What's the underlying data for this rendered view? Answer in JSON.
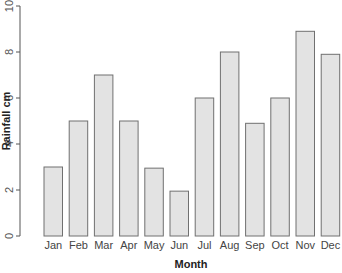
{
  "chart_data": {
    "type": "bar",
    "title": "",
    "xlabel": "Month",
    "ylabel": "Rainfall cm",
    "categories": [
      "Jan",
      "Feb",
      "Mar",
      "Apr",
      "May",
      "Jun",
      "Jul",
      "Aug",
      "Sep",
      "Oct",
      "Nov",
      "Dec"
    ],
    "values": [
      3,
      5,
      7,
      5,
      2.95,
      1.95,
      6,
      8,
      4.9,
      6,
      8.9,
      7.9
    ],
    "ylim": [
      0,
      10
    ],
    "yticks": [
      0,
      2,
      4,
      6,
      8,
      10
    ],
    "grid": false,
    "legend": null,
    "colors": {
      "bar_fill": "#e3e3e3",
      "bar_stroke": "#707070",
      "axis": "#555555"
    }
  }
}
